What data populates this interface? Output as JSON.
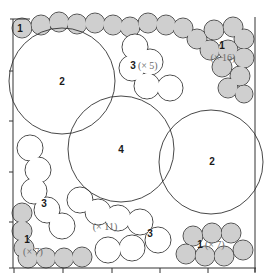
{
  "diagram": {
    "type": "circle-packing",
    "colors": {
      "size1_fill": "#cfcfcf",
      "outline": "#333333",
      "background": "#ffffff",
      "multiplier_text": "#6a6a6a"
    },
    "frame": {
      "x": 13,
      "y": 19,
      "width": 242,
      "height": 249
    },
    "ticks": {
      "bottom_x": [
        14,
        63,
        112,
        160,
        208,
        255
      ],
      "left_y": [
        20,
        71,
        121,
        172,
        222,
        268
      ]
    },
    "large_circles": [
      {
        "id": "circle-2-top-left",
        "size": "2",
        "cx": 62,
        "cy": 81,
        "r": 53
      },
      {
        "id": "circle-4-center",
        "size": "4",
        "cx": 121,
        "cy": 149,
        "r": 53
      },
      {
        "id": "circle-2-right",
        "size": "2",
        "cx": 211,
        "cy": 162,
        "r": 52
      }
    ],
    "labels": [
      {
        "id": "label-top-left-1",
        "num": "1",
        "mult": "",
        "x": 20,
        "y": 32
      },
      {
        "id": "label-top-left-2",
        "num": "2",
        "mult": "",
        "x": 62,
        "y": 85
      },
      {
        "id": "label-top-center-3",
        "num": "3",
        "mult": "(× 5)",
        "x": 144,
        "y": 69
      },
      {
        "id": "label-top-right-1",
        "num": "1",
        "mult": "(× 16)",
        "x": 222,
        "y": 53
      },
      {
        "id": "label-center-4",
        "num": "4",
        "mult": "",
        "x": 121,
        "y": 153
      },
      {
        "id": "label-right-2",
        "num": "2",
        "mult": "",
        "x": 212,
        "y": 165
      },
      {
        "id": "label-left-3",
        "num": "3",
        "mult": "",
        "x": 44,
        "y": 207
      },
      {
        "id": "label-middle-mult",
        "num": "",
        "mult": "(× 11)",
        "x": 105,
        "y": 230
      },
      {
        "id": "label-bottom-center-3",
        "num": "3",
        "mult": "",
        "x": 150,
        "y": 237
      },
      {
        "id": "label-bottom-left-1",
        "num": "1",
        "mult": "(× 7)",
        "x": 27,
        "y": 242
      },
      {
        "id": "label-bottom-right-1",
        "num": "1",
        "mult": "(× 7)",
        "x": 211,
        "y": 247
      }
    ],
    "groups": [
      {
        "size": "1",
        "count": "1",
        "fill": "grey",
        "region": "top-left corner"
      },
      {
        "size": "1",
        "count": "16",
        "fill": "grey",
        "region": "top edge and upper right"
      },
      {
        "size": "1",
        "count": "7",
        "fill": "grey",
        "region": "bottom-left corner"
      },
      {
        "size": "1",
        "count": "7",
        "fill": "grey",
        "region": "bottom-right"
      },
      {
        "size": "2",
        "count": "2",
        "fill": "white",
        "region": "top-left and right"
      },
      {
        "size": "3",
        "count": "5",
        "fill": "white",
        "region": "top center"
      },
      {
        "size": "3",
        "count": "11",
        "fill": "white",
        "region": "lower left and bottom center"
      },
      {
        "size": "4",
        "count": "1",
        "fill": "white",
        "region": "center"
      }
    ]
  }
}
